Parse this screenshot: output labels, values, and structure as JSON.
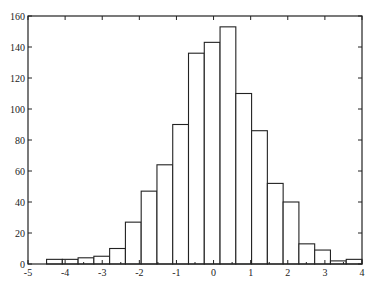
{
  "chart_data": {
    "type": "bar",
    "subtype": "histogram",
    "title": "",
    "xlabel": "",
    "ylabel": "",
    "xlim": [
      -5,
      4
    ],
    "ylim": [
      0,
      160
    ],
    "grid": false,
    "legend": null,
    "x_ticks": [
      -5,
      -4,
      -3,
      -2,
      -1,
      0,
      1,
      2,
      3,
      4
    ],
    "x_tick_labels": [
      "-5",
      "-4",
      "-3",
      "-2",
      "-1",
      "0",
      "1",
      "2",
      "3",
      "4"
    ],
    "y_ticks": [
      0,
      20,
      40,
      60,
      80,
      100,
      120,
      140,
      160
    ],
    "y_tick_labels": [
      "0",
      "20",
      "40",
      "60",
      "80",
      "100",
      "120",
      "140",
      "160"
    ],
    "bin_edges": [
      -4.5,
      -4.075,
      -3.65,
      -3.225,
      -2.8,
      -2.375,
      -1.95,
      -1.525,
      -1.1,
      -0.675,
      -0.25,
      0.175,
      0.6,
      1.025,
      1.45,
      1.875,
      2.3,
      2.725,
      3.15,
      3.575,
      4.0
    ],
    "values": [
      3,
      3,
      4,
      5,
      10,
      27,
      47,
      64,
      90,
      136,
      143,
      153,
      110,
      86,
      52,
      40,
      13,
      9,
      2,
      3
    ],
    "bar_fill": "#ffffff",
    "bar_edge": "#222222"
  }
}
